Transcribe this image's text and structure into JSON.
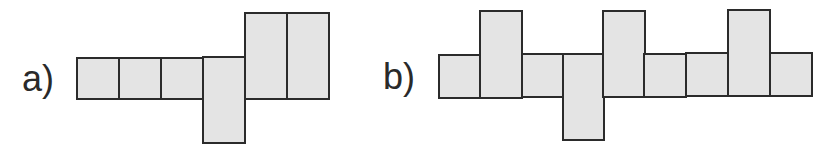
{
  "figures": [
    {
      "id": "a",
      "label": "a)",
      "description": "Net of 7 squares: a row of 4 squares with one square extending down below the 4th, and two stacked columns of squares (2 tall) to the right",
      "cells": [
        {
          "col": 0,
          "row": "base",
          "x": 76,
          "y": 57,
          "w": 44,
          "h": 43
        },
        {
          "col": 1,
          "row": "base",
          "x": 118,
          "y": 57,
          "w": 44,
          "h": 43
        },
        {
          "col": 2,
          "row": "base",
          "x": 160,
          "y": 57,
          "w": 44,
          "h": 43
        },
        {
          "col": 3,
          "row": "base-down",
          "x": 202,
          "y": 56,
          "w": 44,
          "h": 88
        },
        {
          "col": 4,
          "row": "base-up",
          "x": 244,
          "y": 12,
          "w": 44,
          "h": 88
        },
        {
          "col": 5,
          "row": "base-up",
          "x": 286,
          "y": 12,
          "w": 44,
          "h": 88
        }
      ]
    },
    {
      "id": "b",
      "label": "b)",
      "description": "Net of 9 columns: base row of squares with three tall rectangles extending up (columns 2, 5, 8) and one extending down (column 4)",
      "cells": [
        {
          "col": 0,
          "row": "base",
          "x": 438,
          "y": 54,
          "w": 44,
          "h": 45
        },
        {
          "col": 1,
          "row": "base-up",
          "x": 479,
          "y": 10,
          "w": 44,
          "h": 89
        },
        {
          "col": 2,
          "row": "base",
          "x": 521,
          "y": 53,
          "w": 44,
          "h": 45
        },
        {
          "col": 3,
          "row": "base-down",
          "x": 562,
          "y": 53,
          "w": 43,
          "h": 88
        },
        {
          "col": 4,
          "row": "base-up",
          "x": 602,
          "y": 10,
          "w": 44,
          "h": 88
        },
        {
          "col": 5,
          "row": "base",
          "x": 643,
          "y": 53,
          "w": 44,
          "h": 45
        },
        {
          "col": 6,
          "row": "base",
          "x": 685,
          "y": 52,
          "w": 44,
          "h": 45
        },
        {
          "col": 7,
          "row": "base-up",
          "x": 727,
          "y": 9,
          "w": 44,
          "h": 88
        },
        {
          "col": 8,
          "row": "base",
          "x": 769,
          "y": 52,
          "w": 44,
          "h": 45
        }
      ]
    }
  ],
  "colors": {
    "fill": "#e4e4e4",
    "stroke": "#2b2b2b",
    "label": "#2a2a2a",
    "background": "#ffffff"
  }
}
